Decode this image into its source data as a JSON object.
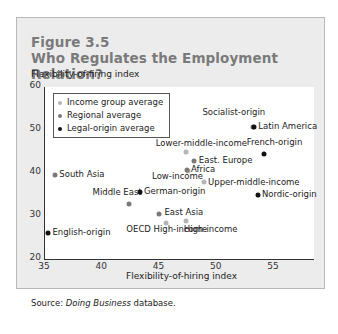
{
  "figure": {
    "number": "Figure 3.5",
    "title": "Who Regulates the Employment Relation?",
    "source_prefix": "Source: ",
    "source_italic": "Doing Business",
    "source_suffix": " database."
  },
  "colors": {
    "income": "#b4b4b4",
    "regional": "#7a7a7a",
    "legal": "#111111",
    "title": "#7a7a7a",
    "panel_bg": "#ececec"
  },
  "chart_data": {
    "type": "scatter",
    "title": "Who Regulates the Employment Relation?",
    "xlabel": "Flexibility-of-hiring index",
    "ylabel": "Flexibility-of-firing index",
    "xlim": [
      35,
      58.5
    ],
    "ylim": [
      20,
      60
    ],
    "xticks": [
      35,
      40,
      45,
      50,
      55
    ],
    "yticks": [
      20,
      30,
      40,
      50,
      60
    ],
    "grid": false,
    "legend_position": "upper left",
    "legend": [
      "Income group average",
      "Regional average",
      "Legal-origin average"
    ],
    "series": [
      {
        "name": "Income group average",
        "points": [
          {
            "label": "Lower-middle-income",
            "x": 47.3,
            "y": 44.9
          },
          {
            "label": "Low-income",
            "x": 47.5,
            "y": 40.5
          },
          {
            "label": "Upper-middle-income",
            "x": 48.9,
            "y": 38.0
          },
          {
            "label": "OECD High-income",
            "x": 45.6,
            "y": 28.4
          },
          {
            "label": "High-income",
            "x": 47.3,
            "y": 28.9
          }
        ]
      },
      {
        "name": "Regional average",
        "points": [
          {
            "label": "Latin America",
            "x": 53.2,
            "y": 50.6
          },
          {
            "label": "East. Europe",
            "x": 48.0,
            "y": 42.7
          },
          {
            "label": "Africa",
            "x": 47.4,
            "y": 40.8
          },
          {
            "label": "South Asia",
            "x": 35.9,
            "y": 39.6
          },
          {
            "label": "Middle East",
            "x": 42.3,
            "y": 32.9
          },
          {
            "label": "East Asia",
            "x": 45.0,
            "y": 30.5
          }
        ]
      },
      {
        "name": "Legal-origin average",
        "points": [
          {
            "label": "Socialist-origin",
            "x": 53.3,
            "y": 50.8
          },
          {
            "label": "French-origin",
            "x": 54.1,
            "y": 44.5
          },
          {
            "label": "Nordic-origin",
            "x": 53.6,
            "y": 34.9
          },
          {
            "label": "German-origin",
            "x": 43.3,
            "y": 35.6
          },
          {
            "label": "English-origin",
            "x": 35.3,
            "y": 26.1
          }
        ]
      }
    ]
  }
}
